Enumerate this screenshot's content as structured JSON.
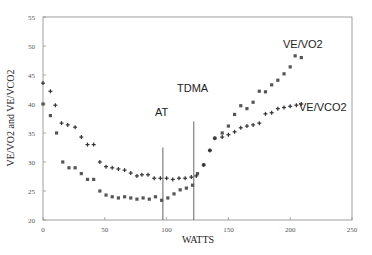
{
  "chart_data": {
    "type": "scatter",
    "title": "",
    "xlabel": "WATTS",
    "ylabel": "VE/VO2 and VE/VCO2",
    "xlim": [
      0,
      250
    ],
    "ylim": [
      20,
      55
    ],
    "xticks": [
      0,
      50,
      100,
      150,
      200,
      250
    ],
    "yticks": [
      20,
      25,
      30,
      35,
      40,
      45,
      50,
      55
    ],
    "grid": false,
    "legend": "none (inline labels)",
    "series": [
      {
        "name": "VE/VO2",
        "marker": "square",
        "x": [
          0,
          6,
          11,
          16,
          21,
          26,
          31,
          36,
          41,
          46,
          51,
          56,
          61,
          66,
          71,
          76,
          81,
          86,
          91,
          96,
          101,
          106,
          111,
          116,
          121,
          125,
          130,
          135,
          139,
          145,
          150,
          155,
          160,
          165,
          170,
          175,
          180,
          185,
          190,
          195,
          200,
          204,
          209
        ],
        "values": [
          40,
          38,
          35,
          30,
          29,
          29,
          28,
          27,
          27,
          25,
          24.3,
          24,
          23.8,
          24,
          23.8,
          23.6,
          23.8,
          23.6,
          24,
          23.4,
          23.8,
          24.5,
          25.2,
          25.5,
          26,
          28,
          29.5,
          32,
          34.1,
          35,
          36.2,
          38.2,
          39.7,
          39.2,
          40.3,
          42.2,
          42.1,
          43.3,
          44.1,
          45.2,
          46.4,
          48.3,
          48
        ]
      },
      {
        "name": "VE/VCO2",
        "marker": "plus",
        "x": [
          0,
          6,
          10,
          15,
          20,
          26,
          31,
          36,
          41,
          46,
          51,
          56,
          61,
          66,
          71,
          76,
          80,
          85,
          90,
          95,
          100,
          105,
          110,
          115,
          120,
          124,
          130,
          135,
          139,
          145,
          150,
          155,
          160,
          165,
          170,
          175,
          180,
          185,
          190,
          195,
          200,
          205,
          209
        ],
        "values": [
          43.6,
          42.2,
          39.8,
          36.7,
          36.4,
          36,
          34.3,
          33,
          33,
          30,
          29.2,
          29,
          28.8,
          28.6,
          28.1,
          27.6,
          27.8,
          27.8,
          27.2,
          27.2,
          27.2,
          27,
          27.2,
          27.2,
          27.4,
          27.6,
          29.5,
          32,
          34.1,
          34.3,
          34.7,
          35.2,
          35.9,
          36.2,
          36.4,
          36.7,
          38.3,
          38.5,
          39.2,
          39.4,
          39.6,
          39.8,
          40
        ]
      }
    ],
    "annotations": [
      {
        "text": "AT",
        "type": "vertical-line",
        "x": 97,
        "from_y": 32.5
      },
      {
        "text": "TDMA",
        "type": "vertical-line",
        "x": 122,
        "from_y": 37
      },
      {
        "text": "VE/VO2",
        "type": "series-label",
        "x": 195,
        "y": 50.5
      },
      {
        "text": "VE/VCO2",
        "type": "series-label",
        "x": 207,
        "y": 39.5
      }
    ]
  },
  "labels": {
    "xlabel": "WATTS",
    "ylabel": "VE/VO2 and VE/VCO2",
    "at": "AT",
    "tdma": "TDMA",
    "vo2": "VE/VO2",
    "vco2": "VE/VCO2"
  },
  "ticks": {
    "x": [
      "0",
      "50",
      "100",
      "150",
      "200",
      "250"
    ],
    "y": [
      "20",
      "25",
      "30",
      "35",
      "40",
      "45",
      "50",
      "55"
    ]
  }
}
